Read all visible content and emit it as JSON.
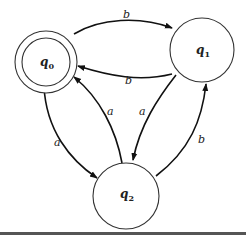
{
  "diagram": {
    "type": "finite-automaton",
    "states": [
      {
        "id": "q0",
        "label": "q",
        "sub": "0",
        "accepting": true
      },
      {
        "id": "q1",
        "label": "q",
        "sub": "1",
        "accepting": false
      },
      {
        "id": "q2",
        "label": "q",
        "sub": "2",
        "accepting": false
      }
    ],
    "transitions": [
      {
        "from": "q0",
        "to": "q1",
        "symbol": "b"
      },
      {
        "from": "q1",
        "to": "q0",
        "symbol": "b"
      },
      {
        "from": "q0",
        "to": "q2",
        "symbol": "a"
      },
      {
        "from": "q2",
        "to": "q0",
        "symbol": "a"
      },
      {
        "from": "q1",
        "to": "q2",
        "symbol": "a"
      },
      {
        "from": "q2",
        "to": "q1",
        "symbol": "b"
      }
    ]
  }
}
